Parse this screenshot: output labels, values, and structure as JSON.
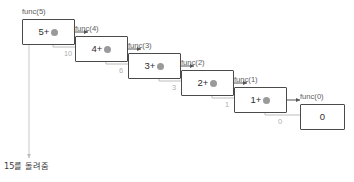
{
  "diagram": {
    "background_color": "#ffffff",
    "box_border_color": "#4a4a4a",
    "call_arrow_color": "#555555",
    "return_arrow_color": "#bdbdbd",
    "placeholder_dot_color": "#9a9a9a",
    "frames": [
      {
        "title": "func(5)",
        "expr": "5+",
        "has_placeholder": true,
        "value": ""
      },
      {
        "title": "func(4)",
        "expr": "4+",
        "has_placeholder": true,
        "value": ""
      },
      {
        "title": "func(3)",
        "expr": "3+",
        "has_placeholder": true,
        "value": ""
      },
      {
        "title": "func(2)",
        "expr": "2+",
        "has_placeholder": true,
        "value": ""
      },
      {
        "title": "func(1)",
        "expr": "1+",
        "has_placeholder": true,
        "value": ""
      },
      {
        "title": "func(0)",
        "expr": "",
        "has_placeholder": false,
        "value": "0"
      }
    ],
    "return_labels": [
      "10",
      "6",
      "3",
      "1",
      "0"
    ],
    "final_caption": "15를 돌려줌"
  }
}
